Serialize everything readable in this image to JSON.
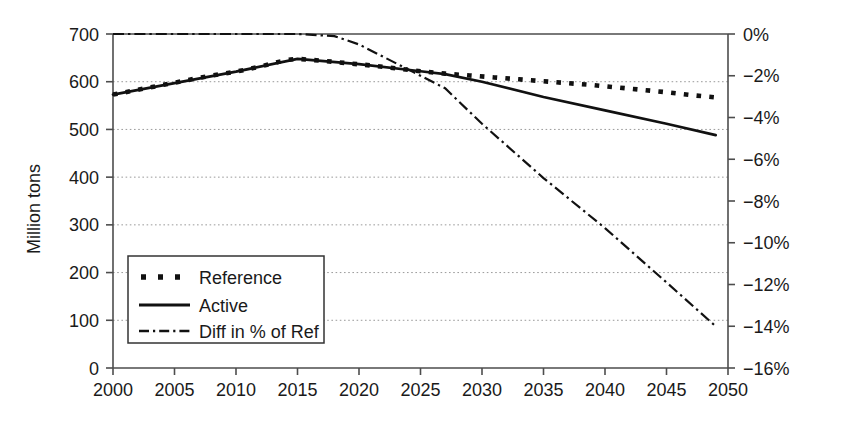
{
  "chart_data": {
    "type": "line",
    "title": "",
    "subtitle": "",
    "xlabel": "",
    "ylabel": "Million tons",
    "ylabel_secondary": "",
    "grid": true,
    "grid_axis": "y",
    "legend_position": "inside-lower-left",
    "x": [
      2000,
      2005,
      2010,
      2015,
      2020,
      2025,
      2030,
      2035,
      2040,
      2045,
      2050
    ],
    "xlim": [
      2000,
      2050
    ],
    "xticks": [
      2000,
      2005,
      2010,
      2015,
      2020,
      2025,
      2030,
      2035,
      2040,
      2045,
      2050
    ],
    "xticklabels": [
      "2000",
      "2005",
      "2010",
      "2015",
      "2020",
      "2025",
      "2030",
      "2035",
      "2040",
      "2045",
      "2050"
    ],
    "ylim": [
      0,
      700
    ],
    "yticks": [
      0,
      100,
      200,
      300,
      400,
      500,
      600,
      700
    ],
    "yticklabels": [
      "0",
      "100",
      "200",
      "300",
      "400",
      "500",
      "600",
      "700"
    ],
    "ylim_secondary": [
      -16,
      0
    ],
    "yticks_secondary": [
      0,
      -2,
      -4,
      -6,
      -8,
      -10,
      -12,
      -14,
      -16
    ],
    "yticklabels_secondary": [
      "0%",
      "−2%",
      "−4%",
      "−6%",
      "−8%",
      "−10%",
      "−12%",
      "−14%",
      "−16%"
    ],
    "series": [
      {
        "name": "Reference",
        "axis": "left",
        "style": "dotted-square",
        "color": "#111111",
        "x": [
          2000,
          2002,
          2004,
          2006,
          2008,
          2010,
          2012,
          2014,
          2015,
          2017,
          2019,
          2021,
          2023,
          2025,
          2027,
          2029,
          2031,
          2033,
          2035,
          2037,
          2039,
          2041,
          2043,
          2045,
          2047,
          2049
        ],
        "values": [
          573,
          583,
          593,
          603,
          613,
          621,
          632,
          645,
          648,
          644,
          639,
          634,
          628,
          622,
          617,
          613,
          609,
          605,
          601,
          597,
          593,
          588,
          583,
          578,
          572,
          567
        ]
      },
      {
        "name": "Active",
        "axis": "left",
        "style": "solid",
        "color": "#111111",
        "x": [
          2000,
          2005,
          2010,
          2015,
          2020,
          2025,
          2027,
          2030,
          2035,
          2040,
          2045,
          2049
        ],
        "values": [
          573,
          597,
          621,
          648,
          637,
          622,
          616,
          600,
          568,
          540,
          512,
          488
        ]
      },
      {
        "name": "Diff in % of Ref",
        "axis": "right",
        "style": "dash-dot",
        "color": "#111111",
        "x": [
          2000,
          2015,
          2018,
          2020,
          2022,
          2025,
          2027,
          2030,
          2035,
          2040,
          2045,
          2049
        ],
        "values": [
          0.0,
          0.0,
          -0.1,
          -0.5,
          -1.1,
          -2.0,
          -2.6,
          -4.3,
          -6.9,
          -9.3,
          -11.9,
          -14.0
        ]
      }
    ],
    "annotations": []
  },
  "legend": {
    "items": [
      {
        "label": "Reference",
        "marker": "dotted-square-marker"
      },
      {
        "label": "Active",
        "marker": "solid-line-marker"
      },
      {
        "label": "Diff in % of Ref",
        "marker": "dash-dot-line-marker"
      }
    ]
  },
  "colors": {
    "ink": "#111111",
    "axis": "#4d4d4d",
    "grid": "#9a9a9a",
    "background": "#ffffff"
  }
}
